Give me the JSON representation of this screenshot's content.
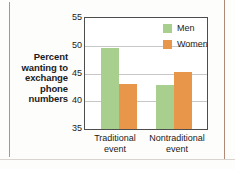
{
  "chart_data": {
    "type": "bar",
    "title": "",
    "subtitle": "",
    "xlabel": "",
    "ylabel": "Percent wanting to exchange phone numbers",
    "ylabel_lines": [
      "Percent",
      "wanting to",
      "exchange",
      "phone",
      "numbers"
    ],
    "categories": [
      "Traditional event",
      "Nontraditional event"
    ],
    "category_lines": [
      [
        "Traditional",
        "event"
      ],
      [
        "Nontraditional",
        "event"
      ]
    ],
    "series": [
      {
        "name": "Men",
        "color": "#a8cf8e",
        "values": [
          49.6,
          43.0
        ]
      },
      {
        "name": "Women",
        "color": "#e8964a",
        "values": [
          43.1,
          45.3
        ]
      }
    ],
    "ylim": [
      35,
      55
    ],
    "yticks": [
      55,
      50,
      45,
      40,
      35
    ],
    "ytick_labels": [
      "55",
      "50",
      "45",
      "40",
      "35"
    ],
    "grid": true,
    "grid_axis": "y",
    "legend_position": "top-right",
    "legend": [
      {
        "label": "Men",
        "color": "#a8cf8e"
      },
      {
        "label": "Women",
        "color": "#e8964a"
      }
    ]
  },
  "colors": {
    "men": "#a8cf8e",
    "women": "#e8964a",
    "axis": "#4d4d4d",
    "grid": "#c7c7c7",
    "text": "#1b1b1b",
    "background": "#fdfdfc",
    "rule_left": "#9a9a98",
    "rule_right": "#b08a76"
  }
}
